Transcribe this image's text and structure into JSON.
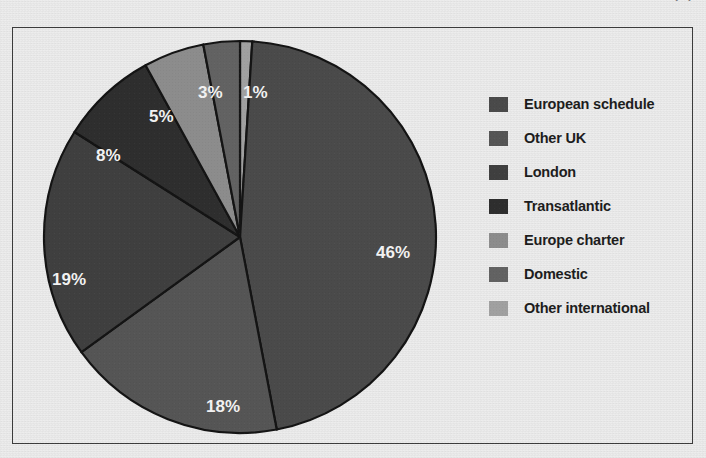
{
  "caption": {
    "text": "FIGURE 3.9  PASSENGERS AT UK AIRPORTS BY TYPE OF SERVICE",
    "right": "(%)"
  },
  "chart_data": {
    "type": "pie",
    "title": "",
    "legend_position": "right",
    "categories": [
      "European schedule",
      "Other UK",
      "London",
      "Transatlantic",
      "Europe charter",
      "Domestic",
      "Other international"
    ],
    "values": [
      46,
      18,
      19,
      8,
      5,
      3,
      1
    ],
    "value_labels": [
      "46%",
      "18%",
      "19%",
      "8%",
      "5%",
      "3%",
      "1%"
    ],
    "unit": "%",
    "total": 100,
    "colors": [
      "#4a4a4a",
      "#555555",
      "#3f3f3f",
      "#2e2e2e",
      "#8c8c8c",
      "#626262",
      "#a0a0a0"
    ],
    "legend_swatch_colors": [
      "#4a4a4a",
      "#555555",
      "#3f3f3f",
      "#2e2e2e",
      "#8c8c8c",
      "#626262",
      "#a0a0a0"
    ],
    "slice_order_clockwise_from_top": [
      {
        "label": "Other international",
        "value": 1
      },
      {
        "label": "European schedule",
        "value": 46
      },
      {
        "label": "Other UK",
        "value": 18
      },
      {
        "label": "London",
        "value": 19
      },
      {
        "label": "Transatlantic",
        "value": 8
      },
      {
        "label": "Europe charter",
        "value": 5
      },
      {
        "label": "Domestic",
        "value": 3
      }
    ],
    "label_positions": [
      {
        "text": "1%",
        "x": 243,
        "y": 98
      },
      {
        "text": "46%",
        "x": 376,
        "y": 258
      },
      {
        "text": "18%",
        "x": 206,
        "y": 412
      },
      {
        "text": "19%",
        "x": 52,
        "y": 285
      },
      {
        "text": "8%",
        "x": 96,
        "y": 161
      },
      {
        "text": "5%",
        "x": 149,
        "y": 122
      },
      {
        "text": "3%",
        "x": 198,
        "y": 98
      }
    ],
    "geometry": {
      "cx": 240,
      "cy": 237,
      "r": 196
    }
  },
  "frame": {
    "border_color": "#3b3b3b",
    "background_color": "#ececec"
  }
}
